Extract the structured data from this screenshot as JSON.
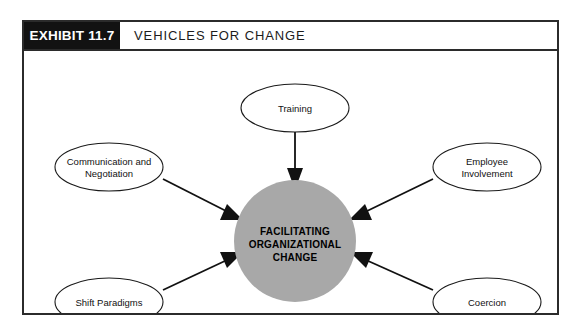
{
  "exhibit": {
    "tag": "EXHIBIT 11.7",
    "title": "VEHICLES FOR CHANGE"
  },
  "diagram": {
    "hub": {
      "line1": "FACILITATING",
      "line2": "ORGANIZATIONAL",
      "line3": "CHANGE",
      "fill_color": "#a8a8a8"
    },
    "nodes": [
      {
        "id": "training",
        "line1": "Training",
        "line2": ""
      },
      {
        "id": "communication-and-negotiation",
        "line1": "Communication and",
        "line2": "Negotiation"
      },
      {
        "id": "employee-involvement",
        "line1": "Employee",
        "line2": "Involvement"
      },
      {
        "id": "shift-paradigms",
        "line1": "Shift Paradigms",
        "line2": ""
      },
      {
        "id": "coercion",
        "line1": "Coercion",
        "line2": ""
      }
    ]
  }
}
